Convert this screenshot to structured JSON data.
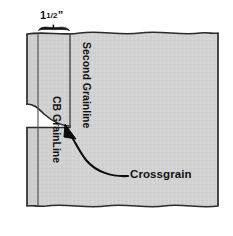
{
  "figure": {
    "kind": "sewing-grainline-diagram",
    "background_color": "#ffffff",
    "fabric_fill_color": "#d2d2d2",
    "fabric_outline_color": "#2b2b2b",
    "line_color": "#3a3a3a",
    "ink_color": "#111111"
  },
  "labels": {
    "measurement_whole": "1",
    "measurement_fraction_numerator": "1",
    "measurement_fraction_denominator": "2",
    "measurement_fraction": "1/2",
    "measurement_unit": "”",
    "measurement_full": "1 1/2”",
    "second_grainline": "Second Grainline",
    "cb_grainline": "CB GrainLine",
    "crossgrain": "Crossgrain"
  },
  "geometry": {
    "fabric_left": 27,
    "fabric_right": 218,
    "fabric_top": 33,
    "fabric_bottom": 207,
    "strip_line_left_x": 38,
    "strip_line_right_x": 70,
    "strip_width_label": "1 1/2”",
    "slit_top_y": 104,
    "slit_bottom_y": 127,
    "bracket_left": 38,
    "bracket_right": 70,
    "bracket_y": 28
  },
  "annotations": {
    "arrow_points_to": "second-grainline-corner",
    "arrow_from": "crossgrain-label",
    "arrow_style": "curved-with-arrowhead"
  }
}
